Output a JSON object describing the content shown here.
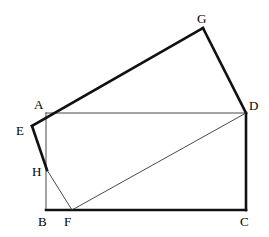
{
  "figure": {
    "canvas": {
      "width": 269,
      "height": 237
    },
    "colors": {
      "stroke_thick": "#111111",
      "stroke_thin": "#333333",
      "background": "#ffffff",
      "label": "#000000"
    },
    "stroke_widths": {
      "thick": 2.6,
      "thin": 0.9
    },
    "points": {
      "A": {
        "x": 46,
        "y": 113,
        "label": "A",
        "label_x": 34,
        "label_y": 98
      },
      "B": {
        "x": 46,
        "y": 210,
        "label": "B",
        "label_x": 38,
        "label_y": 215
      },
      "C": {
        "x": 246,
        "y": 210,
        "label": "C",
        "label_x": 240,
        "label_y": 215
      },
      "D": {
        "x": 246,
        "y": 113,
        "label": "D",
        "label_x": 249,
        "label_y": 99
      },
      "E": {
        "x": 32,
        "y": 126,
        "label": "E",
        "label_x": 16,
        "label_y": 124
      },
      "F": {
        "x": 72,
        "y": 210,
        "label": "F",
        "label_x": 64,
        "label_y": 215
      },
      "G": {
        "x": 203,
        "y": 28,
        "label": "G",
        "label_x": 197,
        "label_y": 12
      },
      "H": {
        "x": 47,
        "y": 170,
        "label": "H",
        "label_x": 32,
        "label_y": 165
      }
    },
    "segments": [
      {
        "name": "segment-AD",
        "from": "A",
        "to": "D",
        "weight": "thin"
      },
      {
        "name": "segment-AB",
        "from": "A",
        "to": "B",
        "weight": "thin"
      },
      {
        "name": "segment-BC",
        "from": "B",
        "to": "C",
        "weight": "thick"
      },
      {
        "name": "segment-CD",
        "from": "C",
        "to": "D",
        "weight": "thick"
      },
      {
        "name": "segment-EG",
        "from": "E",
        "to": "G",
        "weight": "thick"
      },
      {
        "name": "segment-GD",
        "from": "G",
        "to": "D",
        "weight": "thick"
      },
      {
        "name": "segment-EH",
        "from": "E",
        "to": "H",
        "weight": "thick"
      },
      {
        "name": "segment-HF",
        "from": "H",
        "to": "F",
        "weight": "thin"
      },
      {
        "name": "segment-FD",
        "from": "F",
        "to": "D",
        "weight": "thin"
      }
    ],
    "labels_order": [
      "G",
      "A",
      "D",
      "E",
      "H",
      "B",
      "F",
      "C"
    ]
  }
}
